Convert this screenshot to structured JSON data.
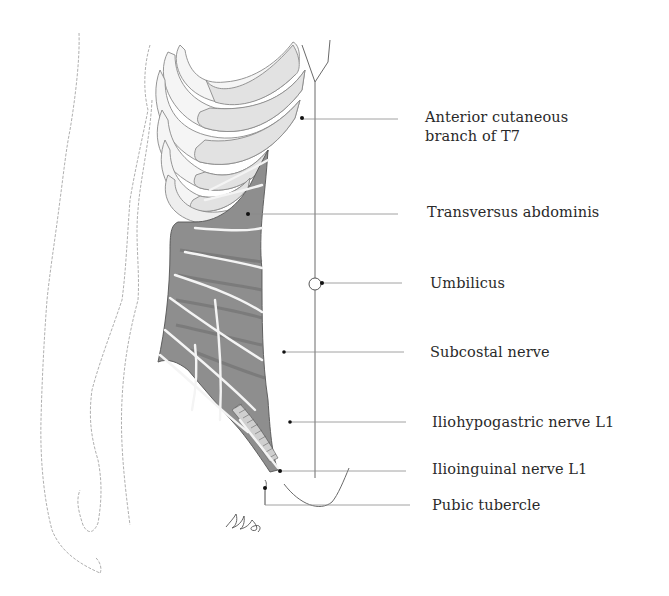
{
  "figure": {
    "colors": {
      "outline": "#6a6a6a",
      "rib": "#e4e4e4",
      "rib_cartilage": "#f6f6f6",
      "muscle": "#8c8c8c",
      "muscle_dark": "#6e6e6e",
      "nerve": "#f4f4f4",
      "leader": "#888888",
      "label_text": "#2a2a2a",
      "dot": "#111111"
    }
  },
  "labels": [
    {
      "id": "anterior-cutaneous-t7",
      "lines": [
        "Anterior cutaneous",
        "branch of T7"
      ],
      "x": 425,
      "y": 108
    },
    {
      "id": "transversus-abdominis",
      "lines": [
        "Transversus abdominis"
      ],
      "x": 427,
      "y": 203
    },
    {
      "id": "umbilicus",
      "lines": [
        "Umbilicus"
      ],
      "x": 430,
      "y": 274
    },
    {
      "id": "subcostal-nerve",
      "lines": [
        "Subcostal nerve"
      ],
      "x": 430,
      "y": 343
    },
    {
      "id": "iliohypogastric-nerve",
      "lines": [
        "Iliohypogastric nerve L1"
      ],
      "x": 432,
      "y": 413
    },
    {
      "id": "ilioinguinal-nerve",
      "lines": [
        "Ilioinguinal nerve L1"
      ],
      "x": 432,
      "y": 460
    },
    {
      "id": "pubic-tubercle",
      "lines": [
        "Pubic tubercle"
      ],
      "x": 432,
      "y": 498
    }
  ],
  "text": {
    "anterior_cutaneous_1": "Anterior cutaneous",
    "anterior_cutaneous_2": "branch of T7",
    "transversus_abdominis": "Transversus abdominis",
    "umbilicus": "Umbilicus",
    "subcostal_nerve": "Subcostal nerve",
    "iliohypogastric_nerve": "Iliohypogastric nerve L1",
    "ilioinguinal_nerve": "Ilioinguinal nerve L1",
    "pubic_tubercle": "Pubic tubercle"
  }
}
